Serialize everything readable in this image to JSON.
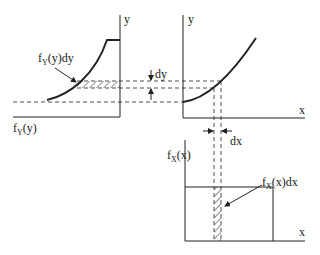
{
  "diagram": {
    "type": "transformation-of-random-variable",
    "colors": {
      "stroke": "#222222",
      "background": "#ffffff"
    },
    "left_panel": {
      "axis_label_vertical": "y",
      "bottom_label_main": "f",
      "bottom_label_sub": "Y",
      "bottom_label_arg": "(y)",
      "annotation_main": "f",
      "annotation_sub": "Y",
      "annotation_arg": "(y)dy"
    },
    "top_right_panel": {
      "axis_label_vertical": "y",
      "axis_label_horizontal": "x",
      "dy_label": "dy"
    },
    "bottom_panel": {
      "axis_label_vertical_main": "f",
      "axis_label_vertical_sub": "X",
      "axis_label_vertical_arg": "(x)",
      "axis_label_horizontal": "x",
      "annotation_main": "f",
      "annotation_sub": "X",
      "annotation_arg": "(x)dx",
      "dx_label": "dx"
    }
  }
}
